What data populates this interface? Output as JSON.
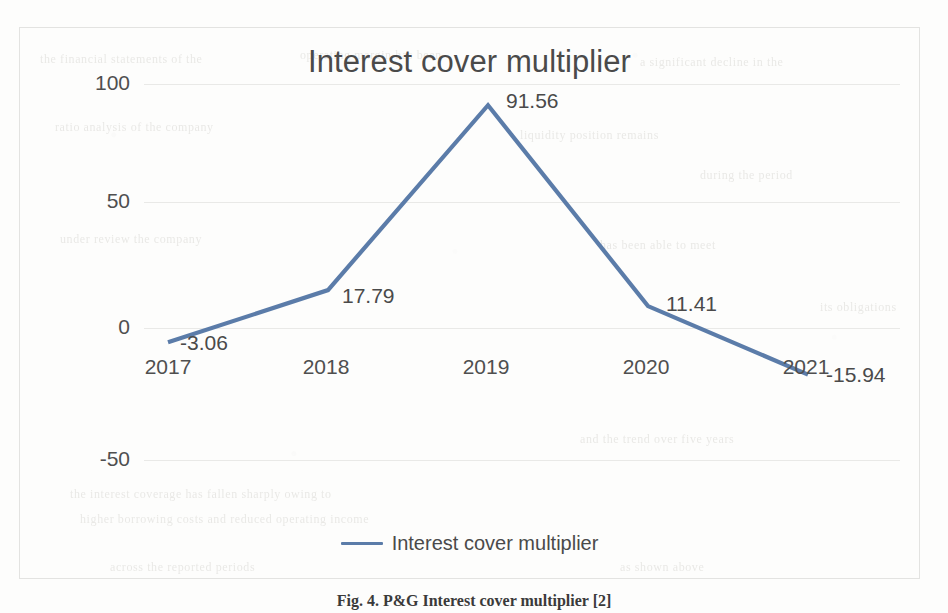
{
  "chart_data": {
    "type": "line",
    "title": "Interest cover multiplier",
    "xlabel": "",
    "ylabel": "",
    "categories": [
      "2017",
      "2018",
      "2019",
      "2020",
      "2021"
    ],
    "series": [
      {
        "name": "Interest cover multiplier",
        "values": [
          -3.06,
          17.79,
          91.56,
          11.41,
          -15.94
        ],
        "color": "#5b7ca9"
      }
    ],
    "data_labels": [
      "-3.06",
      "17.79",
      "91.56",
      "11.41",
      "-15.94"
    ],
    "ylim": [
      -75,
      110
    ],
    "yticks": [
      100,
      50,
      0,
      -50
    ],
    "ytick_labels": [
      "100",
      "50",
      "0",
      "-50"
    ],
    "grid": true,
    "legend": {
      "position": "bottom",
      "entries": [
        "Interest cover multiplier"
      ]
    }
  },
  "figure": {
    "caption": "Fig. 4. P&G Interest cover multiplier [2]"
  },
  "colors": {
    "series_blue": "#5b7ca9",
    "gridline": "#e9e9e7",
    "axis_text": "#4f4f4f",
    "title_text": "#4a4a4a",
    "frame_border": "#e3e3e1",
    "page_background": "#fdfdfc"
  },
  "bleed_through": [
    "the financial statements of the",
    "operating margin has been",
    "a significant decline in the",
    "ratio analysis of the company",
    "liquidity position remains",
    "during the period under review"
  ]
}
